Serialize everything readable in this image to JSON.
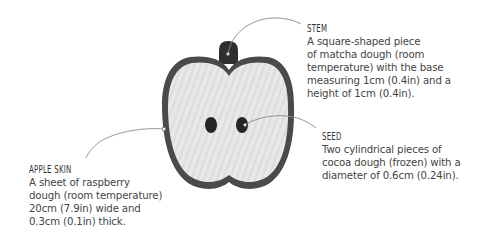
{
  "colors": {
    "background": "#ffffff",
    "apple_flesh": "#e6e6e6",
    "apple_skin": "#4a4a4a",
    "stem": "#2f2f2f",
    "seed": "#252525",
    "leader_line": "#8a8a8a",
    "text": "#444444"
  },
  "diagram": {
    "parts": [
      "stem",
      "apple-skin",
      "flesh",
      "seed-left",
      "seed-right"
    ]
  },
  "callouts": {
    "stem": {
      "title": "STEM",
      "lines": [
        "A square-shaped piece",
        "of matcha dough (room",
        "temperature) with the base",
        "measuring 1cm (0.4in) and a",
        "height of 1cm (0.4in)."
      ]
    },
    "seed": {
      "title": "SEED",
      "lines": [
        "Two cylindrical pieces of",
        "cocoa dough (frozen) with a",
        "diameter of 0.6cm (0.24in)."
      ]
    },
    "skin": {
      "title": "APPLE SKIN",
      "lines": [
        "A sheet of raspberry",
        "dough (room temperature)",
        "20cm (7.9in) wide and",
        "0.3cm (0.1in) thick."
      ]
    }
  }
}
